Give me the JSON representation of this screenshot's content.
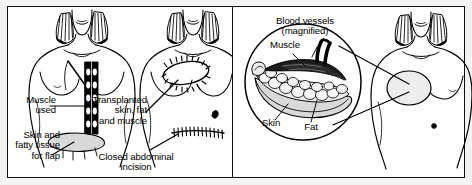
{
  "figure": {
    "panel_count": 2,
    "frame_color": "#111111",
    "background_color": "#ffffff",
    "page_background": "#f3f3f1",
    "line_color": "#000000",
    "skin_fill": "#ffffff",
    "shade_fill": "#d9d9d9",
    "muscle_fill": "#000000"
  },
  "panels": [
    {
      "id": "donor-site-panel",
      "name": "Donor site and flap harvest",
      "figures": [
        {
          "id": "figure-muscle-flap",
          "caption": "Torso showing rectus muscle strip and lower abdominal skin flap"
        },
        {
          "id": "figure-post-transfer",
          "caption": "Torso showing transplanted tissue and closed abdominal incision"
        }
      ],
      "labels": [
        {
          "id": "label-muscle-used",
          "text": "Muscle\nused",
          "align": "right",
          "points_to": "rectus-abdominis-strip"
        },
        {
          "id": "label-skin-fatty-tissue",
          "text": "Skin and\nfatty tissue\nfor flap",
          "align": "right",
          "points_to": "abdominal-skin-flap"
        },
        {
          "id": "label-transplanted-tissue",
          "text": "Transplanted\nskin, fat\nand muscle",
          "align": "right",
          "points_to": "reconstructed-breast-sutures"
        },
        {
          "id": "label-closed-incision",
          "text": "Closed abdominal\nincision",
          "align": "center",
          "points_to": "abdominal-suture-line"
        }
      ]
    },
    {
      "id": "magnified-flap-panel",
      "name": "Magnified flap cross-section and result",
      "figures": [
        {
          "id": "figure-magnified-inset",
          "caption": "Circular magnified cross-section of transferred tissue flap"
        },
        {
          "id": "figure-result-torso",
          "caption": "Torso showing completed reconstructed breast"
        }
      ],
      "labels": [
        {
          "id": "label-blood-vessels",
          "text": "Blood vessels\n(magnified)",
          "align": "center",
          "points_to": "blood-vessel-pedicle"
        },
        {
          "id": "label-muscle",
          "text": "Muscle",
          "align": "center",
          "points_to": "muscle-layer"
        },
        {
          "id": "label-skin",
          "text": "Skin",
          "align": "center",
          "points_to": "skin-layer"
        },
        {
          "id": "label-fat",
          "text": "Fat",
          "align": "center",
          "points_to": "fat-layer"
        }
      ]
    }
  ]
}
